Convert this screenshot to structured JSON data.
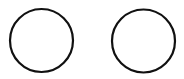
{
  "canvas": {
    "width": 184,
    "height": 79,
    "background": "#ffffff"
  },
  "shapes": [
    {
      "type": "circle",
      "name": "left-circle",
      "cx": 41.5,
      "cy": 40.5,
      "r": 31.5,
      "stroke": "#111111",
      "stroke_width": 2.2,
      "fill": "#ffffff"
    },
    {
      "type": "circle",
      "name": "right-circle",
      "cx": 143.5,
      "cy": 41,
      "r": 31.5,
      "stroke": "#111111",
      "stroke_width": 2.2,
      "fill": "#ffffff"
    }
  ]
}
